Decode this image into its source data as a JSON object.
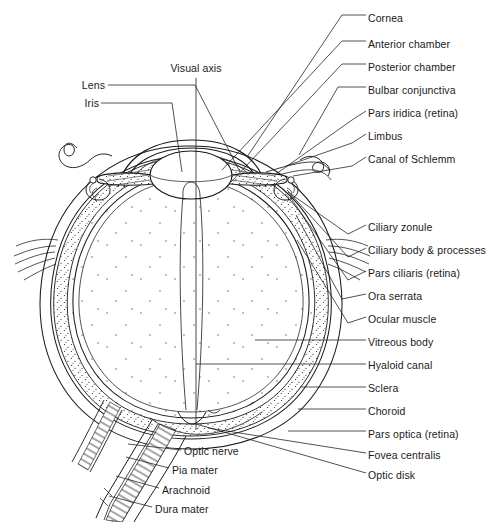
{
  "figure": {
    "domain": "anatomical-diagram",
    "background_color": "#ffffff",
    "line_color": "#1a1a1a",
    "text_color": "#1a1a1a",
    "width": 490,
    "height": 522
  },
  "axis_label": {
    "text": "Visual axis",
    "x": 196,
    "y": 68
  },
  "labels_left": [
    {
      "id": "lens",
      "text": "Lens",
      "x": 103,
      "y": 85,
      "leader": [
        [
          108,
          85
        ],
        [
          195,
          85
        ],
        [
          240,
          172
        ]
      ]
    },
    {
      "id": "iris",
      "text": "Iris",
      "x": 97,
      "y": 103,
      "leader": [
        [
          101,
          103
        ],
        [
          172,
          103
        ],
        [
          182,
          172
        ]
      ]
    }
  ],
  "labels_right": [
    {
      "id": "cornea",
      "text": "Cornea",
      "x": 368,
      "y": 18,
      "leader": [
        [
          342,
          15
        ],
        [
          366,
          15
        ]
      ],
      "extra": [
        [
          247,
          157
        ],
        [
          342,
          15
        ]
      ]
    },
    {
      "id": "anterior-chamber",
      "text": "Anterior chamber",
      "x": 368,
      "y": 44,
      "leader": [
        [
          342,
          41
        ],
        [
          366,
          41
        ]
      ],
      "extra": [
        [
          222,
          170
        ],
        [
          342,
          41
        ]
      ]
    },
    {
      "id": "posterior-chamber",
      "text": "Posterior chamber",
      "x": 368,
      "y": 67,
      "leader": [
        [
          342,
          64
        ],
        [
          366,
          64
        ]
      ],
      "extra": [
        [
          231,
          182
        ],
        [
          342,
          64
        ]
      ]
    },
    {
      "id": "bulbar-conjunctiva",
      "text": "Bulbar conjunctiva",
      "x": 368,
      "y": 90,
      "leader": [
        [
          338,
          87
        ],
        [
          366,
          87
        ]
      ],
      "extra": [
        [
          299,
          155
        ],
        [
          338,
          87
        ]
      ]
    },
    {
      "id": "pars-iridica",
      "text": "Pars iridica (retina)",
      "x": 368,
      "y": 113,
      "leader": [
        [
          352,
          120
        ],
        [
          366,
          111
        ]
      ],
      "extra": [
        [
          276,
          174
        ],
        [
          352,
          120
        ]
      ]
    },
    {
      "id": "limbus",
      "text": "Limbus",
      "x": 368,
      "y": 136,
      "leader": [
        [
          352,
          143
        ],
        [
          366,
          134
        ]
      ],
      "extra": [
        [
          286,
          166
        ],
        [
          352,
          143
        ]
      ]
    },
    {
      "id": "canal-of-schlemm",
      "text": "Canal of Schlemm",
      "x": 368,
      "y": 159,
      "leader": [
        [
          352,
          166
        ],
        [
          366,
          157
        ]
      ],
      "extra": [
        [
          293,
          176
        ],
        [
          352,
          166
        ]
      ]
    },
    {
      "id": "ciliary-zonule",
      "text": "Ciliary zonule",
      "x": 368,
      "y": 227,
      "leader": [
        [
          348,
          234
        ],
        [
          366,
          225
        ]
      ],
      "extra": [
        [
          288,
          192
        ],
        [
          348,
          234
        ]
      ]
    },
    {
      "id": "ciliary-body",
      "text": "Ciliary body & processes",
      "x": 368,
      "y": 250,
      "leader": [
        [
          348,
          257
        ],
        [
          366,
          248
        ]
      ],
      "extra": [
        [
          287,
          190
        ],
        [
          348,
          257
        ]
      ]
    },
    {
      "id": "pars-ciliaris",
      "text": "Pars ciliaris (retina)",
      "x": 368,
      "y": 273,
      "leader": [
        [
          348,
          280
        ],
        [
          366,
          271
        ]
      ],
      "extra": [
        [
          290,
          197
        ],
        [
          348,
          280
        ]
      ]
    },
    {
      "id": "ora-serrata",
      "text": "Ora serrata",
      "x": 368,
      "y": 296,
      "leader": [
        [
          342,
          299
        ],
        [
          366,
          294
        ]
      ],
      "extra": [
        [
          296,
          215
        ],
        [
          342,
          299
        ]
      ]
    },
    {
      "id": "ocular-muscle",
      "text": "Ocular muscle",
      "x": 368,
      "y": 319,
      "leader": [
        [
          348,
          323
        ],
        [
          366,
          317
        ]
      ],
      "extra": [
        [
          297,
          240
        ],
        [
          348,
          323
        ]
      ]
    },
    {
      "id": "vitreous-body",
      "text": "Vitreous body",
      "x": 368,
      "y": 342,
      "leader": [
        [
          255,
          340
        ],
        [
          366,
          340
        ]
      ]
    },
    {
      "id": "hyaloid-canal",
      "text": "Hyaloid canal",
      "x": 368,
      "y": 366,
      "leader": [
        [
          196,
          364
        ],
        [
          366,
          364
        ]
      ]
    },
    {
      "id": "sclera",
      "text": "Sclera",
      "x": 368,
      "y": 389,
      "leader": [
        [
          300,
          387
        ],
        [
          366,
          387
        ]
      ]
    },
    {
      "id": "choroid",
      "text": "Choroid",
      "x": 368,
      "y": 411,
      "leader": [
        [
          298,
          409
        ],
        [
          366,
          409
        ]
      ]
    },
    {
      "id": "pars-optica",
      "text": "Pars optica (retina)",
      "x": 368,
      "y": 434,
      "leader": [
        [
          288,
          431
        ],
        [
          366,
          431
        ]
      ]
    },
    {
      "id": "fovea-centralis",
      "text": "Fovea centralis",
      "x": 368,
      "y": 455,
      "leader": [
        [
          208,
          428
        ],
        [
          366,
          453
        ]
      ]
    },
    {
      "id": "optic-disk",
      "text": "Optic disk",
      "x": 368,
      "y": 475,
      "leader": [
        [
          196,
          424
        ],
        [
          366,
          473
        ]
      ]
    }
  ],
  "labels_nerve": [
    {
      "id": "optic-nerve",
      "text": "Optic nerve",
      "x": 184,
      "y": 451,
      "leader": [
        [
          128,
          444
        ],
        [
          181,
          450
        ]
      ]
    },
    {
      "id": "pia-mater",
      "text": "Pia mater",
      "x": 172,
      "y": 470,
      "leader": [
        [
          126,
          457
        ],
        [
          169,
          468
        ]
      ]
    },
    {
      "id": "arachnoid",
      "text": "Arachnoid",
      "x": 162,
      "y": 490,
      "leader": [
        [
          116,
          476
        ],
        [
          159,
          488
        ]
      ]
    },
    {
      "id": "dura-mater",
      "text": "Dura mater",
      "x": 155,
      "y": 509,
      "leader": [
        [
          109,
          496
        ],
        [
          152,
          507
        ]
      ]
    }
  ],
  "structures": {
    "globe_outer": "outer sclera boundary of the eyeball",
    "globe_center": {
      "cx": 192,
      "cy": 288
    },
    "lens": {
      "cx": 191,
      "cy": 175,
      "rx": 40,
      "ry": 24
    },
    "optic_nerve": "nerve trunk exiting posteroinferiorly to the lower-left",
    "ocular_muscle_left": "muscle fibers entering at left mid-globe",
    "ocular_muscle_right": "muscle fibers entering at right mid-globe"
  }
}
